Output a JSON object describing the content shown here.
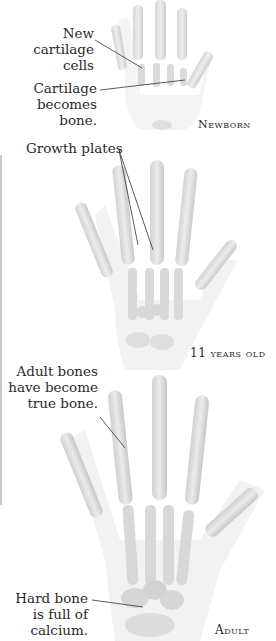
{
  "figure": {
    "stages": [
      {
        "id": "newborn",
        "label": "Newborn",
        "annotations": [
          {
            "text": "New cartilage cells"
          },
          {
            "text": "Cartilage becomes bone."
          }
        ]
      },
      {
        "id": "eleven",
        "label": "11 years old",
        "annotations": [
          {
            "text": "Growth plates"
          }
        ]
      },
      {
        "id": "adult",
        "label": "Adult",
        "annotations": [
          {
            "text": "Adult bones have become true bone."
          },
          {
            "text": "Hard bone is full of calcium."
          }
        ]
      }
    ],
    "labels": {
      "new_cartilage_l1": "New cartilage",
      "new_cartilage_l2": "cells",
      "cartilage_bone_l1": "Cartilage",
      "cartilage_bone_l2": "becomes bone.",
      "growth_plates": "Growth plates",
      "adult_l1": "Adult bones",
      "adult_l2": "have become",
      "adult_l3": "true bone.",
      "hard_l1": "Hard bone",
      "hard_l2": "is full of",
      "hard_l3": "calcium."
    },
    "colors": {
      "bone": "#d9d9d9",
      "bone_dark": "#b5b5b5",
      "flesh": "#efefef",
      "line": "#333333"
    }
  }
}
